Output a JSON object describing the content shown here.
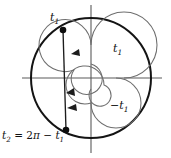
{
  "figure": {
    "type": "unit-circle-angle-diagram",
    "background_color": "#ffffff",
    "stroke_color": "#1a1a1a",
    "axis_color": "#555555",
    "spiral_color": "#6b6b6b"
  },
  "labels": {
    "t1_point": {
      "base": "t",
      "sub": "1"
    },
    "t1_inner": {
      "base": "t",
      "sub": "1"
    },
    "minus_t1": {
      "prefix": "−",
      "base": "t",
      "sub": "1"
    },
    "t2_equation": {
      "lhs_base": "t",
      "lhs_sub": "2",
      "equals": "=",
      "coefficient": "2",
      "pi": "π",
      "minus": "−",
      "rhs_base": "t",
      "rhs_sub": "1",
      "full_text": "t2 = 2π − t1"
    }
  },
  "geometry": {
    "center": {
      "x": 91,
      "y": 78
    },
    "outer_circle_radius": 60,
    "axes": {
      "horizontal": {
        "x1": 22,
        "x2": 162,
        "y": 78
      },
      "vertical": {
        "x": 91,
        "y1": 5,
        "y2": 153
      }
    },
    "points": [
      {
        "name": "t1-point",
        "x": 63,
        "y": 30,
        "radius": 3.2
      },
      {
        "name": "t2-point",
        "x": 66,
        "y": 130,
        "radius": 3.2
      }
    ],
    "chord": {
      "x1": 63,
      "y1": 30,
      "x2": 66,
      "y2": 130
    },
    "arrow_markers": [
      {
        "name": "chord-arrow-upper",
        "x": 78,
        "y": 52
      },
      {
        "name": "chord-arrow-middle",
        "x": 73,
        "y": 92
      },
      {
        "name": "chord-arrow-lower",
        "x": 74,
        "y": 107
      }
    ],
    "spirals": [
      {
        "name": "t1-spiral-ccw",
        "direction": "counterclockwise",
        "outer_radius": 33,
        "inner_radius": 14
      },
      {
        "name": "minus-t1-spiral-cw",
        "direction": "clockwise",
        "outer_radius": 25,
        "inner_radius": 10
      }
    ]
  }
}
